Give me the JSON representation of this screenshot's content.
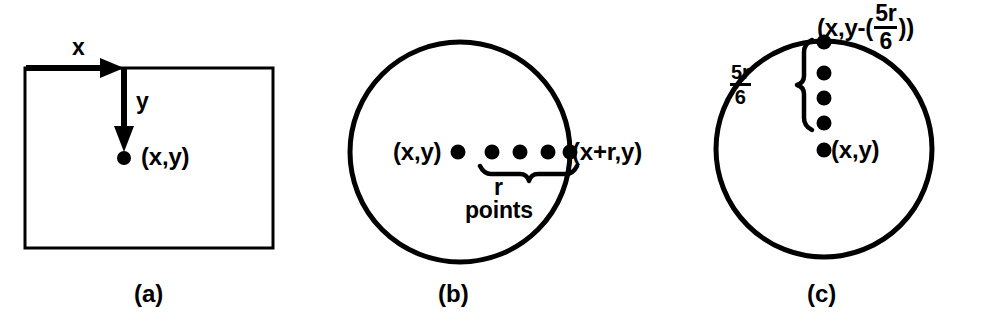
{
  "figure": {
    "background_color": "#ffffff",
    "ink_color": "#000000",
    "panel_count": 3
  },
  "panels": [
    {
      "id": "a",
      "caption": "(a)",
      "shape": "rectangle",
      "labels": {
        "x_axis": "x",
        "y_axis": "y",
        "point": "(x,y)"
      },
      "arrows": [
        {
          "name": "x-arrow",
          "direction": "right"
        },
        {
          "name": "y-arrow",
          "direction": "down"
        }
      ],
      "dots": 1
    },
    {
      "id": "b",
      "caption": "(b)",
      "shape": "circle",
      "labels": {
        "center_point": "(x,y)",
        "edge_point": "(x+r,y)",
        "brace_top": "r",
        "brace_bottom": "points"
      },
      "dot_count": 5,
      "brace": {
        "name": "r-points-brace",
        "orientation": "horizontal-down"
      }
    },
    {
      "id": "c",
      "caption": "(c)",
      "shape": "circle",
      "labels": {
        "center_point": "(x,y)",
        "top_point_prefix": "(x,y-(",
        "top_point_numerator": "5r",
        "top_point_denominator": "6",
        "top_point_suffix": "))",
        "brace_numerator": "5r",
        "brace_denominator": "6"
      },
      "dot_count": 5,
      "brace": {
        "name": "five-r-over-six-brace",
        "orientation": "vertical-left"
      }
    }
  ]
}
